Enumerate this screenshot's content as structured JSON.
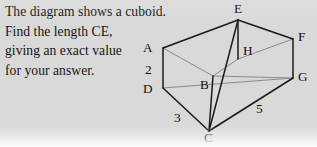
{
  "page": {
    "background_color": "#d9d9d9",
    "ink_color": "#141414"
  },
  "question": {
    "lines": [
      "The diagram shows a cuboid.",
      "Find the length CE,",
      "giving an exact value",
      "for your answer."
    ]
  },
  "diagram": {
    "type": "cuboid-3d-sketch",
    "solid_edge_color": "#1a1a1a",
    "hidden_edge_color": "#8a8a8a",
    "vertex_labels": [
      {
        "name": "E",
        "text": "E",
        "x": 234,
        "y": 2
      },
      {
        "name": "F",
        "text": "F",
        "x": 298,
        "y": 30
      },
      {
        "name": "A",
        "text": "A",
        "x": 143,
        "y": 41
      },
      {
        "name": "H",
        "text": "H",
        "x": 243,
        "y": 44
      },
      {
        "name": "G",
        "text": "G",
        "x": 298,
        "y": 70
      },
      {
        "name": "B",
        "text": "B",
        "x": 200,
        "y": 78
      },
      {
        "name": "D",
        "text": "D",
        "x": 143,
        "y": 82
      },
      {
        "name": "C",
        "text": "C",
        "x": 204,
        "y": 131
      }
    ],
    "measure_labels": [
      {
        "name": "height-2",
        "text": "2",
        "x": 145,
        "y": 63
      },
      {
        "name": "depth-3",
        "text": "3",
        "x": 174,
        "y": 111
      },
      {
        "name": "width-5",
        "text": "5",
        "x": 256,
        "y": 102
      }
    ],
    "geometry": {
      "points": {
        "E": [
          238,
          20
        ],
        "F": [
          293,
          39
        ],
        "A": [
          163,
          48
        ],
        "H": [
          238,
          59
        ],
        "B": [
          213,
          76
        ],
        "G": [
          293,
          78
        ],
        "D": [
          163,
          88
        ],
        "C": [
          209,
          131
        ]
      },
      "solid_edges": [
        [
          "A",
          "E"
        ],
        [
          "E",
          "F"
        ],
        [
          "A",
          "D"
        ],
        [
          "F",
          "G"
        ],
        [
          "D",
          "C"
        ],
        [
          "C",
          "G"
        ],
        [
          "E",
          "H"
        ],
        [
          "E",
          "C"
        ],
        [
          "B",
          "C"
        ]
      ],
      "hidden_edges": [
        [
          "A",
          "B"
        ],
        [
          "B",
          "H"
        ],
        [
          "H",
          "F"
        ],
        [
          "B",
          "G"
        ],
        [
          "D",
          "G"
        ]
      ]
    }
  }
}
